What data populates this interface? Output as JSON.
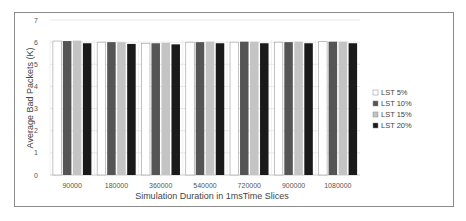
{
  "chart_data": {
    "type": "bar",
    "title": "",
    "xlabel": "Simulation Duration in  1msTime Slices",
    "ylabel": "Average Bad Packets (K)",
    "ylim": [
      0,
      7
    ],
    "yticks": [
      "0",
      "1",
      "2",
      "3",
      "4",
      "5",
      "6",
      "7"
    ],
    "grid": true,
    "legend_position": "right",
    "categories": [
      "90000",
      "180000",
      "360000",
      "540000",
      "720000",
      "900000",
      "1080000"
    ],
    "series": [
      {
        "name": "LST 5%",
        "color": "#ffffff",
        "values": [
          6.05,
          6.0,
          5.95,
          6.0,
          6.0,
          6.0,
          6.02
        ]
      },
      {
        "name": "LST 10%",
        "color": "#555555",
        "values": [
          6.05,
          6.0,
          5.95,
          6.0,
          6.02,
          6.0,
          6.02
        ]
      },
      {
        "name": "LST 15%",
        "color": "#c4c4c4",
        "values": [
          6.07,
          6.0,
          5.97,
          6.02,
          6.02,
          6.02,
          6.02
        ]
      },
      {
        "name": "LST 20%",
        "color": "#1a1a1a",
        "values": [
          5.95,
          5.92,
          5.9,
          5.95,
          5.95,
          5.95,
          5.95
        ]
      }
    ]
  }
}
